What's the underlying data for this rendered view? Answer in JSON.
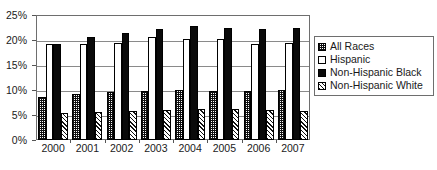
{
  "chart_data": {
    "type": "bar",
    "title": "",
    "subtitle": "",
    "xlabel": "",
    "ylabel": "",
    "categories": [
      "2000",
      "2001",
      "2002",
      "2003",
      "2004",
      "2005",
      "2006",
      "2007"
    ],
    "ylim": [
      0,
      25
    ],
    "y_ticks": [
      0,
      5,
      10,
      15,
      20,
      25
    ],
    "y_tick_labels": [
      "0%",
      "5%",
      "10%",
      "15%",
      "20%",
      "25%"
    ],
    "grid": true,
    "legend_position": "right",
    "series": [
      {
        "name": "All Races",
        "pattern": "checkerboard",
        "values": [
          8.6,
          9.2,
          9.6,
          9.9,
          10.0,
          9.9,
          9.8,
          10.0
        ]
      },
      {
        "name": "Hispanic",
        "pattern": "solid-white",
        "values": [
          19.2,
          19.3,
          19.5,
          20.6,
          20.3,
          20.2,
          19.2,
          19.5
        ]
      },
      {
        "name": "Non-Hispanic Black",
        "pattern": "solid-black",
        "values": [
          19.3,
          20.6,
          21.5,
          22.2,
          22.8,
          22.5,
          22.3,
          22.4
        ]
      },
      {
        "name": "Non-Hispanic White",
        "pattern": "diagonal-hatch",
        "values": [
          5.4,
          5.7,
          5.9,
          6.1,
          6.3,
          6.2,
          6.1,
          5.9
        ]
      }
    ]
  },
  "legend": {
    "items": [
      {
        "label": "All Races",
        "swatch": "checkerboard-swatch-icon"
      },
      {
        "label": "Hispanic",
        "swatch": "white-square-swatch-icon"
      },
      {
        "label": "Non-Hispanic Black",
        "swatch": "black-square-swatch-icon"
      },
      {
        "label": "Non-Hispanic White",
        "swatch": "hatched-square-swatch-icon"
      }
    ]
  }
}
